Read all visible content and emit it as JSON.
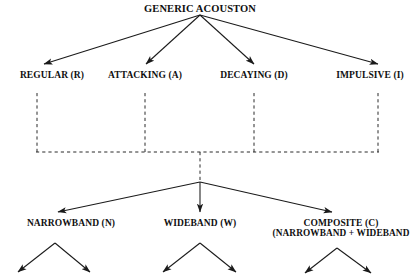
{
  "diagram": {
    "title": "GENERIC ACOUSTON",
    "type": "hierarchical-tree",
    "root": {
      "label": "GENERIC ACOUSTON",
      "x": 200,
      "y": 8
    },
    "level1": {
      "name": "acouston-types",
      "nodes": [
        {
          "label": "REGULAR (R)",
          "x": 52,
          "y": 76
        },
        {
          "label": "ATTACKING (A)",
          "x": 145,
          "y": 76
        },
        {
          "label": "DECAYING (D)",
          "x": 254,
          "y": 76
        },
        {
          "label": "IMPULSIVE (I)",
          "x": 370,
          "y": 76
        }
      ]
    },
    "level2": {
      "name": "bandwidth-classes",
      "nodes": [
        {
          "label": "NARROWBAND (N)",
          "sub": "",
          "x": 71,
          "y": 222
        },
        {
          "label": "WIDEBAND (W)",
          "sub": "",
          "x": 200,
          "y": 222
        },
        {
          "label": "COMPOSITE (C)",
          "sub": "(NARROWBAND + WIDEBAND",
          "x": 341,
          "y": 222
        }
      ]
    },
    "connectors": {
      "dashed_bus_y": 152,
      "dashed_verticals_x": [
        37,
        145,
        254,
        378
      ],
      "junction": {
        "x": 200,
        "y": 182
      },
      "style": "dashed-bus-with-solid-arrows"
    },
    "colors": {
      "ink": "#101010",
      "line": "#1a1a1a",
      "background": "#ffffff"
    }
  }
}
